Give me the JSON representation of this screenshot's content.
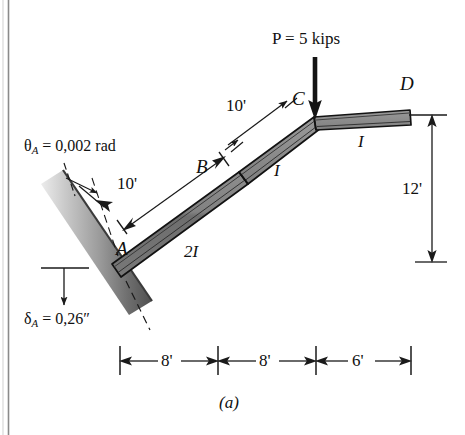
{
  "figure": {
    "caption": "(a)",
    "domain_note": "structural frame diagram"
  },
  "load": {
    "label": "P = 5 kips",
    "symbol": "P",
    "value": "5",
    "units": "kips",
    "arrow_icon": "down-arrow-icon"
  },
  "support": {
    "rotation_label_symbol": "θ",
    "rotation_label_sub": "A",
    "rotation_label_value": "= 0,002 rad",
    "rotation_label_full": "θA = 0,002 rad",
    "settlement_label_symbol": "δ",
    "settlement_label_sub": "A",
    "settlement_label_value": "= 0,26″",
    "settlement_label_full": "δA = 0,26″",
    "type": "inclined-fixed-wall"
  },
  "nodes": [
    {
      "id": "A",
      "label": "A"
    },
    {
      "id": "B",
      "label": "B"
    },
    {
      "id": "C",
      "label": "C"
    },
    {
      "id": "D",
      "label": "D"
    }
  ],
  "members": [
    {
      "id": "AB",
      "stiffness_label": "2I",
      "from": "A",
      "to": "B"
    },
    {
      "id": "BC",
      "stiffness_label": "I",
      "from": "B",
      "to": "C"
    },
    {
      "id": "CD",
      "stiffness_label": "I",
      "from": "C",
      "to": "D"
    }
  ],
  "dimensions": {
    "inclined": [
      {
        "id": "AB-length",
        "label": "10'"
      },
      {
        "id": "BC-length",
        "label": "10'"
      }
    ],
    "horizontal": [
      {
        "id": "span-1",
        "label": "8'"
      },
      {
        "id": "span-2",
        "label": "8'"
      },
      {
        "id": "span-3",
        "label": "6'"
      }
    ],
    "vertical": [
      {
        "id": "height-CD",
        "label": "12'"
      }
    ]
  },
  "colors": {
    "beam_fill": "#7d7d7d",
    "beam_fill_light": "#a8a8a8",
    "beam_outline": "#121212",
    "wall_dark": "#5e5e5e",
    "wall_light": "#e4e4e4",
    "line": "#1a1a1a",
    "background": "#ffffff"
  }
}
